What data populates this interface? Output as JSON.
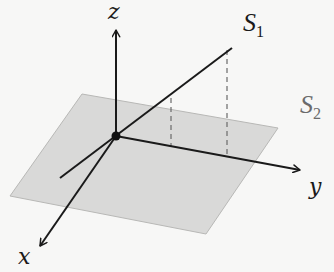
{
  "diagram": {
    "type": "3d-coordinate-system",
    "axes": {
      "z": {
        "label": "z"
      },
      "y": {
        "label": "y"
      },
      "x": {
        "label": "x"
      }
    },
    "surfaces": [
      {
        "name": "S",
        "subscript": "1",
        "kind": "line"
      },
      {
        "name": "S",
        "subscript": "2",
        "kind": "plane"
      }
    ],
    "colors": {
      "background": "#f7f7f6",
      "plane_fill": "#d9d9d8",
      "plane_edge": "#b8b8b6",
      "ink": "#1a1a1a",
      "dashed": "#6a6a6a",
      "s2_label": "#6b6b6b"
    }
  }
}
